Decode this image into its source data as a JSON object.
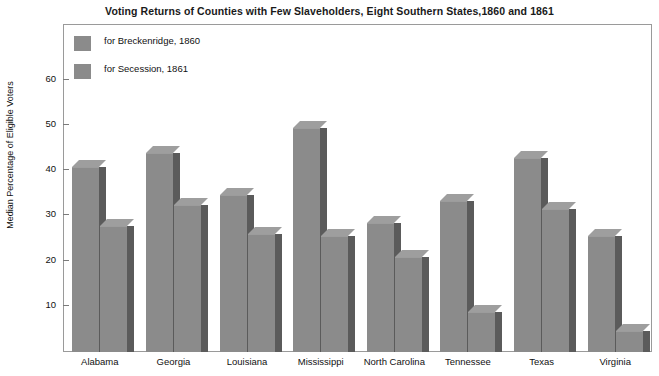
{
  "chart_data": {
    "type": "bar",
    "title": "Voting Returns of Counties with Few Slaveholders, Eight Southern States,1860 and 1861",
    "xlabel": "",
    "ylabel": "Median Percentage of Eligible Voters",
    "categories": [
      "Alabama",
      "Georgia",
      "Louisiana",
      "Mississippi",
      "North Carolina",
      "Tennessee",
      "Texas",
      "Virginia"
    ],
    "series": [
      {
        "name": "for Breckenridge, 1860",
        "color": "#8b8b8b",
        "values": [
          41.0,
          44.0,
          34.7,
          49.6,
          28.6,
          33.3,
          43.0,
          25.6
        ]
      },
      {
        "name": "for Secession, 1861",
        "color": "#8b8b8b",
        "values": [
          27.8,
          32.5,
          26.2,
          25.6,
          21.0,
          8.8,
          31.7,
          4.6
        ]
      }
    ],
    "ylim": [
      0,
      65
    ],
    "yticks": [
      10,
      20,
      30,
      40,
      50,
      60
    ],
    "ytick_labels": [
      "10",
      "20",
      "30",
      "40",
      "50",
      "60"
    ],
    "grid": false,
    "legend_position": "top-left",
    "bar_style": "3d-shaded",
    "bar_face_color": "#8b8b8b",
    "bar_side_color": "#5b5b5b",
    "bar_top_color": "#9e9e9e",
    "frame_color": "#9a9a9a"
  }
}
